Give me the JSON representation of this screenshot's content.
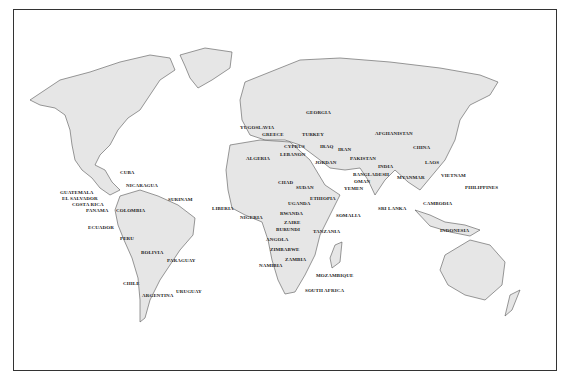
{
  "map": {
    "type": "world political outline map",
    "labels": [
      {
        "name": "GEORGIA",
        "x": 306,
        "y": 110
      },
      {
        "name": "YUGOSLAVIA",
        "x": 240,
        "y": 125
      },
      {
        "name": "GREECE",
        "x": 262,
        "y": 132
      },
      {
        "name": "TURKEY",
        "x": 302,
        "y": 132
      },
      {
        "name": "AFGHANISTAN",
        "x": 375,
        "y": 131
      },
      {
        "name": "CYPRUS",
        "x": 284,
        "y": 144
      },
      {
        "name": "IRAQ",
        "x": 320,
        "y": 144
      },
      {
        "name": "IRAN",
        "x": 338,
        "y": 147
      },
      {
        "name": "CHINA",
        "x": 413,
        "y": 145
      },
      {
        "name": "LEBANON",
        "x": 280,
        "y": 152
      },
      {
        "name": "ALGERIA",
        "x": 246,
        "y": 156
      },
      {
        "name": "PAKISTAN",
        "x": 350,
        "y": 156
      },
      {
        "name": "JORDAN",
        "x": 315,
        "y": 160
      },
      {
        "name": "LAOS",
        "x": 425,
        "y": 160
      },
      {
        "name": "INDIA",
        "x": 378,
        "y": 164
      },
      {
        "name": "CUBA",
        "x": 120,
        "y": 170
      },
      {
        "name": "BANGLADESH",
        "x": 353,
        "y": 172
      },
      {
        "name": "VIETNAM",
        "x": 441,
        "y": 173
      },
      {
        "name": "MYANMAR",
        "x": 397,
        "y": 175
      },
      {
        "name": "OMAN",
        "x": 354,
        "y": 179
      },
      {
        "name": "CHAD",
        "x": 278,
        "y": 180
      },
      {
        "name": "NICARAGUA",
        "x": 126,
        "y": 183
      },
      {
        "name": "PHILIPPINES",
        "x": 465,
        "y": 185
      },
      {
        "name": "SUDAN",
        "x": 296,
        "y": 185
      },
      {
        "name": "YEMEN",
        "x": 344,
        "y": 186
      },
      {
        "name": "GUATEMALA",
        "x": 60,
        "y": 190
      },
      {
        "name": "EL SALVADOR",
        "x": 62,
        "y": 196
      },
      {
        "name": "SURINAM",
        "x": 168,
        "y": 197
      },
      {
        "name": "COSTA RICA",
        "x": 72,
        "y": 202
      },
      {
        "name": "ETHIOPIA",
        "x": 310,
        "y": 196
      },
      {
        "name": "CAMBODIA",
        "x": 423,
        "y": 201
      },
      {
        "name": "UGANDA",
        "x": 288,
        "y": 201
      },
      {
        "name": "PANAMA",
        "x": 86,
        "y": 208
      },
      {
        "name": "COLOMBIA",
        "x": 116,
        "y": 208
      },
      {
        "name": "LIBERIA",
        "x": 212,
        "y": 206
      },
      {
        "name": "SRI LANKA",
        "x": 378,
        "y": 206
      },
      {
        "name": "RWANDA",
        "x": 280,
        "y": 211
      },
      {
        "name": "SOMALIA",
        "x": 336,
        "y": 213
      },
      {
        "name": "NIGERIA",
        "x": 240,
        "y": 215
      },
      {
        "name": "ZAIRE",
        "x": 284,
        "y": 220
      },
      {
        "name": "ECUADOR",
        "x": 88,
        "y": 225
      },
      {
        "name": "INDONESIA",
        "x": 440,
        "y": 228
      },
      {
        "name": "BURUNDI",
        "x": 276,
        "y": 227
      },
      {
        "name": "TANZANIA",
        "x": 313,
        "y": 229
      },
      {
        "name": "PERU",
        "x": 120,
        "y": 236
      },
      {
        "name": "ANGOLA",
        "x": 266,
        "y": 237
      },
      {
        "name": "ZIMBABWE",
        "x": 270,
        "y": 247
      },
      {
        "name": "BOLIVIA",
        "x": 141,
        "y": 250
      },
      {
        "name": "PARAGUAY",
        "x": 167,
        "y": 258
      },
      {
        "name": "ZAMBIA",
        "x": 285,
        "y": 257
      },
      {
        "name": "NAMIBIA",
        "x": 259,
        "y": 263
      },
      {
        "name": "MOZAMBIQUE",
        "x": 316,
        "y": 273
      },
      {
        "name": "CHILE",
        "x": 123,
        "y": 281
      },
      {
        "name": "SOUTH AFRICA",
        "x": 305,
        "y": 288
      },
      {
        "name": "URUGUAY",
        "x": 176,
        "y": 289
      },
      {
        "name": "ARGENTINA",
        "x": 142,
        "y": 293
      }
    ]
  }
}
